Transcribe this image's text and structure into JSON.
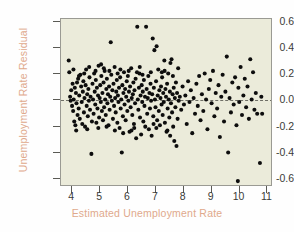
{
  "chart_data": {
    "type": "scatter",
    "title": "",
    "xlabel": "Estimated Unemployment Rate",
    "ylabel": "Unemployment Rate Residual",
    "xlim": [
      3.6,
      11.2
    ],
    "ylim": [
      -0.66,
      0.62
    ],
    "xticks": [
      "4",
      "5",
      "6",
      "7",
      "8",
      "9",
      "10",
      "11"
    ],
    "xtick_values": [
      4,
      5,
      6,
      7,
      8,
      9,
      10,
      11
    ],
    "yticks": [
      "0.6",
      "0.4",
      "0.2",
      "0.0",
      "-0.2",
      "-0.4",
      "-0.6"
    ],
    "ytick_values": [
      0.6,
      0.4,
      0.2,
      0.0,
      -0.2,
      -0.4,
      -0.6
    ],
    "grid": false,
    "legend": "none",
    "reference_line": {
      "orientation": "horizontal",
      "y": 0.0,
      "style": "dashed",
      "color": "#6f6f66"
    },
    "marker": {
      "shape": "circle",
      "color": "#0d0d0d",
      "size_px": 3.4
    },
    "plot_background": "#ebebda",
    "figure_background": "#fefefe",
    "axis_label_color": "#e0a98c",
    "tick_label_color": "#3b3b38",
    "n_points": 286,
    "points": [
      [
        3.88,
        0.3
      ],
      [
        3.9,
        0.21
      ],
      [
        3.93,
        0.02
      ],
      [
        3.95,
        -0.01
      ],
      [
        3.97,
        0.07
      ],
      [
        4.0,
        -0.05
      ],
      [
        4.02,
        0.12
      ],
      [
        4.04,
        -0.09
      ],
      [
        4.06,
        0.0
      ],
      [
        4.08,
        -0.17
      ],
      [
        4.1,
        0.09
      ],
      [
        4.12,
        -0.2
      ],
      [
        4.14,
        0.05
      ],
      [
        4.16,
        -0.03
      ],
      [
        4.18,
        0.13
      ],
      [
        4.2,
        -0.12
      ],
      [
        4.22,
        0.16
      ],
      [
        4.24,
        -0.07
      ],
      [
        4.26,
        0.03
      ],
      [
        4.28,
        -0.15
      ],
      [
        4.3,
        0.19
      ],
      [
        4.33,
        0.1
      ],
      [
        4.35,
        -0.02
      ],
      [
        4.37,
        -0.19
      ],
      [
        4.39,
        0.06
      ],
      [
        4.41,
        0.14
      ],
      [
        4.43,
        -0.1
      ],
      [
        4.45,
        0.01
      ],
      [
        4.47,
        -0.21
      ],
      [
        4.49,
        0.11
      ],
      [
        4.51,
        0.23
      ],
      [
        4.53,
        -0.05
      ],
      [
        4.55,
        0.04
      ],
      [
        4.57,
        -0.13
      ],
      [
        4.59,
        0.08
      ],
      [
        4.61,
        -0.01
      ],
      [
        4.63,
        0.17
      ],
      [
        4.65,
        -0.08
      ],
      [
        4.67,
        0.02
      ],
      [
        4.7,
        -0.42
      ],
      [
        4.72,
        -0.17
      ],
      [
        4.74,
        0.12
      ],
      [
        4.76,
        0.0
      ],
      [
        4.78,
        -0.11
      ],
      [
        4.8,
        0.2
      ],
      [
        4.82,
        0.06
      ],
      [
        4.84,
        -0.04
      ],
      [
        4.86,
        0.15
      ],
      [
        4.88,
        -0.18
      ],
      [
        4.9,
        0.09
      ],
      [
        4.92,
        -0.07
      ],
      [
        4.94,
        0.03
      ],
      [
        4.96,
        0.26
      ],
      [
        4.98,
        -0.14
      ],
      [
        5.0,
        0.01
      ],
      [
        5.02,
        0.11
      ],
      [
        5.04,
        -0.02
      ],
      [
        5.06,
        0.18
      ],
      [
        5.08,
        -0.09
      ],
      [
        5.1,
        0.05
      ],
      [
        5.12,
        -0.16
      ],
      [
        5.14,
        0.13
      ],
      [
        5.16,
        -0.06
      ],
      [
        5.18,
        0.22
      ],
      [
        5.2,
        0.0
      ],
      [
        5.22,
        -0.12
      ],
      [
        5.24,
        0.08
      ],
      [
        5.26,
        0.16
      ],
      [
        5.28,
        -0.03
      ],
      [
        5.3,
        0.04
      ],
      [
        5.32,
        -0.2
      ],
      [
        5.34,
        0.1
      ],
      [
        5.36,
        -0.08
      ],
      [
        5.38,
        0.02
      ],
      [
        5.4,
        0.44
      ],
      [
        5.42,
        0.19
      ],
      [
        5.44,
        -0.01
      ],
      [
        5.46,
        0.07
      ],
      [
        5.48,
        -0.15
      ],
      [
        5.5,
        0.12
      ],
      [
        5.52,
        -0.05
      ],
      [
        5.54,
        0.25
      ],
      [
        5.56,
        0.01
      ],
      [
        5.58,
        -0.1
      ],
      [
        5.6,
        0.06
      ],
      [
        5.62,
        0.15
      ],
      [
        5.64,
        -0.18
      ],
      [
        5.66,
        0.03
      ],
      [
        5.68,
        -0.02
      ],
      [
        5.7,
        0.09
      ],
      [
        5.72,
        -0.22
      ],
      [
        5.74,
        0.17
      ],
      [
        5.76,
        -0.07
      ],
      [
        5.78,
        0.0
      ],
      [
        5.8,
        -0.41
      ],
      [
        5.82,
        0.11
      ],
      [
        5.84,
        -0.13
      ],
      [
        5.86,
        0.05
      ],
      [
        5.88,
        0.21
      ],
      [
        5.9,
        -0.04
      ],
      [
        5.92,
        0.08
      ],
      [
        5.94,
        -0.16
      ],
      [
        5.96,
        0.02
      ],
      [
        5.98,
        0.14
      ],
      [
        6.0,
        -0.09
      ],
      [
        6.02,
        0.18
      ],
      [
        6.04,
        -0.01
      ],
      [
        6.06,
        0.06
      ],
      [
        6.08,
        -0.25
      ],
      [
        6.1,
        0.1
      ],
      [
        6.12,
        -0.06
      ],
      [
        6.14,
        0.24
      ],
      [
        6.16,
        0.01
      ],
      [
        6.18,
        -0.12
      ],
      [
        6.2,
        0.04
      ],
      [
        6.22,
        0.13
      ],
      [
        6.24,
        -0.19
      ],
      [
        6.26,
        0.07
      ],
      [
        6.28,
        -0.03
      ],
      [
        6.3,
        0.16
      ],
      [
        6.32,
        -0.3
      ],
      [
        6.36,
        0.56
      ],
      [
        6.38,
        0.0
      ],
      [
        6.4,
        -0.08
      ],
      [
        6.42,
        0.09
      ],
      [
        6.44,
        0.2
      ],
      [
        6.46,
        -0.14
      ],
      [
        6.48,
        0.03
      ],
      [
        6.5,
        -0.27
      ],
      [
        6.52,
        0.11
      ],
      [
        6.54,
        -0.02
      ],
      [
        6.56,
        0.06
      ],
      [
        6.58,
        -0.17
      ],
      [
        6.6,
        0.15
      ],
      [
        6.62,
        -0.05
      ],
      [
        6.64,
        0.02
      ],
      [
        6.68,
        0.56
      ],
      [
        6.7,
        0.08
      ],
      [
        6.72,
        -0.11
      ],
      [
        6.74,
        0.01
      ],
      [
        6.76,
        0.18
      ],
      [
        6.78,
        -0.23
      ],
      [
        6.8,
        0.05
      ],
      [
        6.82,
        -0.07
      ],
      [
        6.84,
        0.12
      ],
      [
        6.86,
        -0.01
      ],
      [
        6.88,
        -0.28
      ],
      [
        6.9,
        0.04
      ],
      [
        6.92,
        0.47
      ],
      [
        6.94,
        -0.13
      ],
      [
        6.96,
        0.09
      ],
      [
        6.98,
        0.38
      ],
      [
        7.0,
        0.0
      ],
      [
        7.02,
        -0.06
      ],
      [
        7.04,
        0.14
      ],
      [
        7.06,
        0.41
      ],
      [
        7.08,
        -0.16
      ],
      [
        7.1,
        0.03
      ],
      [
        7.12,
        0.23
      ],
      [
        7.14,
        -0.09
      ],
      [
        7.16,
        0.07
      ],
      [
        7.18,
        -0.2
      ],
      [
        7.2,
        0.01
      ],
      [
        7.22,
        0.1
      ],
      [
        7.24,
        -0.04
      ],
      [
        7.26,
        0.17
      ],
      [
        7.28,
        -0.12
      ],
      [
        7.3,
        0.05
      ],
      [
        7.32,
        -0.02
      ],
      [
        7.34,
        0.3
      ],
      [
        7.36,
        -0.18
      ],
      [
        7.38,
        0.08
      ],
      [
        7.4,
        0.02
      ],
      [
        7.42,
        -0.25
      ],
      [
        7.44,
        0.12
      ],
      [
        7.46,
        -0.07
      ],
      [
        7.48,
        0.2
      ],
      [
        7.5,
        0.0
      ],
      [
        7.52,
        -0.14
      ],
      [
        7.54,
        0.06
      ],
      [
        7.56,
        0.28
      ],
      [
        7.58,
        -0.03
      ],
      [
        7.6,
        0.31
      ],
      [
        7.62,
        -0.1
      ],
      [
        7.64,
        0.04
      ],
      [
        7.66,
        -0.21
      ],
      [
        7.68,
        0.09
      ],
      [
        7.7,
        -0.32
      ],
      [
        7.72,
        0.01
      ],
      [
        7.74,
        -0.06
      ],
      [
        7.76,
        0.13
      ],
      [
        7.78,
        -0.36
      ],
      [
        7.8,
        0.05
      ],
      [
        7.82,
        -0.15
      ],
      [
        7.84,
        0.24
      ],
      [
        7.86,
        -0.01
      ],
      [
        7.9,
        0.02
      ],
      [
        7.95,
        -0.08
      ],
      [
        8.0,
        0.1
      ],
      [
        8.05,
        -0.04
      ],
      [
        8.1,
        0.03
      ],
      [
        8.15,
        -0.19
      ],
      [
        8.2,
        0.14
      ],
      [
        8.25,
        -0.02
      ],
      [
        8.3,
        0.07
      ],
      [
        8.35,
        -0.26
      ],
      [
        8.4,
        0.01
      ],
      [
        8.45,
        -0.11
      ],
      [
        8.5,
        0.12
      ],
      [
        8.55,
        -0.05
      ],
      [
        8.6,
        0.18
      ],
      [
        8.65,
        -0.16
      ],
      [
        8.7,
        0.04
      ],
      [
        8.75,
        -0.09
      ],
      [
        8.8,
        0.2
      ],
      [
        8.85,
        0.0
      ],
      [
        8.9,
        -0.23
      ],
      [
        8.95,
        0.08
      ],
      [
        9.0,
        0.15
      ],
      [
        9.05,
        -0.03
      ],
      [
        9.1,
        0.22
      ],
      [
        9.15,
        -0.13
      ],
      [
        9.2,
        0.05
      ],
      [
        9.25,
        -0.07
      ],
      [
        9.3,
        0.11
      ],
      [
        9.35,
        -0.29
      ],
      [
        9.4,
        0.02
      ],
      [
        9.45,
        0.19
      ],
      [
        9.5,
        -0.17
      ],
      [
        9.55,
        0.06
      ],
      [
        9.6,
        0.33
      ],
      [
        9.65,
        -0.41
      ],
      [
        9.7,
        0.01
      ],
      [
        9.75,
        -0.1
      ],
      [
        9.8,
        0.13
      ],
      [
        9.85,
        -0.04
      ],
      [
        9.9,
        0.17
      ],
      [
        9.95,
        -0.2
      ],
      [
        10.0,
        -0.63
      ],
      [
        10.02,
        0.09
      ],
      [
        10.05,
        -0.02
      ],
      [
        10.1,
        0.25
      ],
      [
        10.15,
        -0.12
      ],
      [
        10.2,
        0.03
      ],
      [
        10.25,
        0.16
      ],
      [
        10.3,
        -0.06
      ],
      [
        10.35,
        0.1
      ],
      [
        10.4,
        -0.15
      ],
      [
        10.45,
        0.31
      ],
      [
        10.5,
        0.0
      ],
      [
        10.55,
        0.21
      ],
      [
        10.6,
        -0.08
      ],
      [
        10.65,
        0.05
      ],
      [
        10.7,
        -0.11
      ],
      [
        10.8,
        -0.49
      ],
      [
        10.85,
        0.02
      ],
      [
        10.88,
        -0.11
      ],
      [
        4.05,
        0.23
      ],
      [
        4.44,
        0.2
      ],
      [
        4.62,
        0.25
      ],
      [
        5.05,
        0.27
      ],
      [
        5.35,
        0.22
      ],
      [
        5.55,
        -0.24
      ],
      [
        5.85,
        -0.26
      ],
      [
        6.05,
        0.22
      ],
      [
        6.25,
        -0.22
      ],
      [
        6.45,
        0.25
      ],
      [
        6.65,
        -0.21
      ],
      [
        6.85,
        0.21
      ],
      [
        7.05,
        -0.22
      ],
      [
        7.25,
        0.21
      ],
      [
        7.45,
        -0.24
      ],
      [
        7.65,
        0.18
      ],
      [
        4.15,
        -0.24
      ],
      [
        4.55,
        -0.23
      ],
      [
        4.95,
        -0.22
      ],
      [
        5.15,
        0.24
      ],
      [
        5.65,
        0.2
      ],
      [
        6.15,
        -0.24
      ],
      [
        6.55,
        0.19
      ],
      [
        6.95,
        -0.19
      ],
      [
        7.35,
        0.22
      ],
      [
        4.25,
        0.18
      ],
      [
        4.85,
        0.22
      ],
      [
        5.25,
        -0.21
      ],
      [
        5.75,
        0.23
      ],
      [
        6.35,
        0.21
      ],
      [
        7.55,
        -0.28
      ]
    ]
  }
}
